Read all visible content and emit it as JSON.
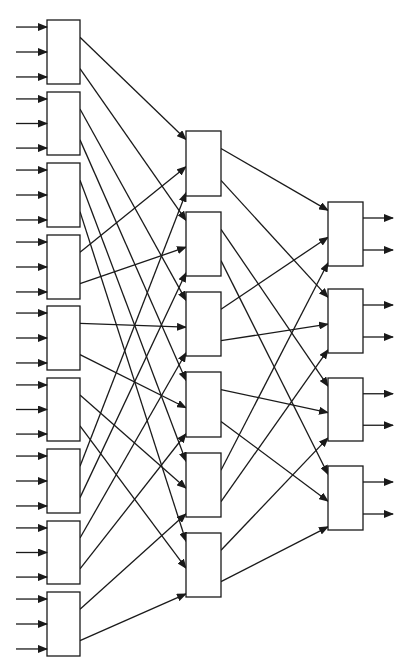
{
  "diagram": {
    "type": "multistage-interconnection-network",
    "stroke_color": "#1a1a1a",
    "background": "#ffffff",
    "stages": [
      {
        "name": "stage-1",
        "x": 47,
        "width": 33,
        "box_count": 9,
        "inputs_per_box": 3,
        "outputs_per_box": 2,
        "boxes": [
          {
            "y": 20,
            "h": 64
          },
          {
            "y": 92,
            "h": 63
          },
          {
            "y": 163,
            "h": 64
          },
          {
            "y": 235,
            "h": 64
          },
          {
            "y": 306,
            "h": 64
          },
          {
            "y": 378,
            "h": 63
          },
          {
            "y": 449,
            "h": 64
          },
          {
            "y": 521,
            "h": 63
          },
          {
            "y": 592,
            "h": 64
          }
        ]
      },
      {
        "name": "stage-2",
        "x": 186,
        "width": 35,
        "box_count": 6,
        "inputs_per_box": 3,
        "outputs_per_box": 2,
        "boxes": [
          {
            "y": 131,
            "h": 65
          },
          {
            "y": 212,
            "h": 64
          },
          {
            "y": 292,
            "h": 64
          },
          {
            "y": 372,
            "h": 65
          },
          {
            "y": 453,
            "h": 64
          },
          {
            "y": 533,
            "h": 64
          }
        ]
      },
      {
        "name": "stage-3",
        "x": 328,
        "width": 35,
        "box_count": 4,
        "inputs_per_box": 3,
        "outputs_per_box": 2,
        "boxes": [
          {
            "y": 202,
            "h": 64
          },
          {
            "y": 289,
            "h": 64
          },
          {
            "y": 378,
            "h": 63
          },
          {
            "y": 466,
            "h": 64
          }
        ]
      }
    ],
    "input_arrows": {
      "x_start": 16,
      "fractions": [
        0.11,
        0.5,
        0.89
      ]
    },
    "output_arrows": {
      "length": 30,
      "fractions": [
        0.25,
        0.75
      ]
    },
    "port_fractions": {
      "out": [
        0.27,
        0.76
      ],
      "in": [
        0.13,
        0.55,
        0.95
      ]
    },
    "links_1_to_2": [
      {
        "from": [
          0,
          0
        ],
        "to": [
          0,
          0
        ]
      },
      {
        "from": [
          0,
          1
        ],
        "to": [
          1,
          0
        ]
      },
      {
        "from": [
          1,
          0
        ],
        "to": [
          2,
          0
        ]
      },
      {
        "from": [
          1,
          1
        ],
        "to": [
          3,
          0
        ]
      },
      {
        "from": [
          2,
          0
        ],
        "to": [
          4,
          0
        ]
      },
      {
        "from": [
          2,
          1
        ],
        "to": [
          5,
          0
        ]
      },
      {
        "from": [
          3,
          0
        ],
        "to": [
          0,
          1
        ]
      },
      {
        "from": [
          3,
          1
        ],
        "to": [
          1,
          1
        ]
      },
      {
        "from": [
          4,
          0
        ],
        "to": [
          2,
          1
        ]
      },
      {
        "from": [
          4,
          1
        ],
        "to": [
          3,
          1
        ]
      },
      {
        "from": [
          5,
          0
        ],
        "to": [
          4,
          1
        ]
      },
      {
        "from": [
          5,
          1
        ],
        "to": [
          5,
          1
        ]
      },
      {
        "from": [
          6,
          0
        ],
        "to": [
          0,
          2
        ]
      },
      {
        "from": [
          6,
          1
        ],
        "to": [
          1,
          2
        ]
      },
      {
        "from": [
          7,
          0
        ],
        "to": [
          2,
          2
        ]
      },
      {
        "from": [
          7,
          1
        ],
        "to": [
          3,
          2
        ]
      },
      {
        "from": [
          8,
          0
        ],
        "to": [
          4,
          2
        ]
      },
      {
        "from": [
          8,
          1
        ],
        "to": [
          5,
          2
        ]
      }
    ],
    "links_2_to_3": [
      {
        "from": [
          0,
          0
        ],
        "to": [
          0,
          0
        ]
      },
      {
        "from": [
          0,
          1
        ],
        "to": [
          1,
          0
        ]
      },
      {
        "from": [
          1,
          0
        ],
        "to": [
          2,
          0
        ]
      },
      {
        "from": [
          1,
          1
        ],
        "to": [
          3,
          0
        ]
      },
      {
        "from": [
          2,
          0
        ],
        "to": [
          0,
          1
        ]
      },
      {
        "from": [
          2,
          1
        ],
        "to": [
          1,
          1
        ]
      },
      {
        "from": [
          3,
          0
        ],
        "to": [
          2,
          1
        ]
      },
      {
        "from": [
          3,
          1
        ],
        "to": [
          3,
          1
        ]
      },
      {
        "from": [
          4,
          0
        ],
        "to": [
          0,
          2
        ]
      },
      {
        "from": [
          4,
          1
        ],
        "to": [
          1,
          2
        ]
      },
      {
        "from": [
          5,
          0
        ],
        "to": [
          2,
          2
        ]
      },
      {
        "from": [
          5,
          1
        ],
        "to": [
          3,
          2
        ]
      }
    ]
  }
}
